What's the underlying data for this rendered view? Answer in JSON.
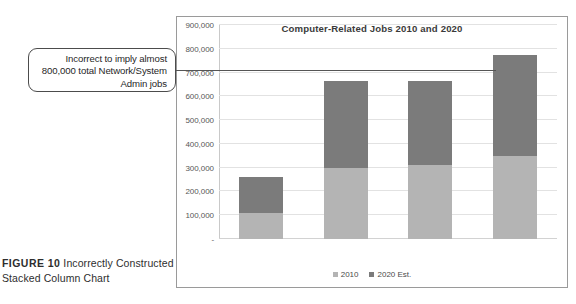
{
  "figure": {
    "label": "FIGURE 10",
    "caption": "Incorrectly Constructed Stacked Column Chart"
  },
  "callout": {
    "text": "Incorrect to imply almost 800,000 total Network/System Admin jobs",
    "line_value": 775000,
    "border_color": "#4c4c4c"
  },
  "chart_data": {
    "type": "bar",
    "subtype": "stacked-column",
    "title": "Computer-Related Jobs 2010 and 2020",
    "xlabel": "",
    "ylabel": "",
    "ylim": [
      0,
      900000
    ],
    "ytick_step": 100000,
    "ytick_labels": [
      "900,000",
      "800,000",
      "700,000",
      "600,000",
      "500,000",
      "400,000",
      "300,000",
      "200,000",
      "100,000",
      "-"
    ],
    "ytick_values": [
      900000,
      800000,
      700000,
      600000,
      500000,
      400000,
      300000,
      200000,
      100000,
      0
    ],
    "grid": true,
    "legend_position": "bottom",
    "categories": [
      "Database Administrators",
      "Info Security Analysts",
      "CIS Managers",
      "Network/System Admins"
    ],
    "series": [
      {
        "name": "2010",
        "color": "#b4b4b4",
        "values": [
          110000,
          300000,
          310000,
          350000
        ]
      },
      {
        "name": "2020 Est.",
        "color": "#7b7b7b",
        "values": [
          150000,
          365000,
          355000,
          425000
        ]
      }
    ],
    "stacked_totals": [
      260000,
      665000,
      665000,
      775000
    ]
  },
  "legend": {
    "items": [
      {
        "label": "2010",
        "color": "#b4b4b4"
      },
      {
        "label": "2020 Est.",
        "color": "#7b7b7b"
      }
    ]
  }
}
